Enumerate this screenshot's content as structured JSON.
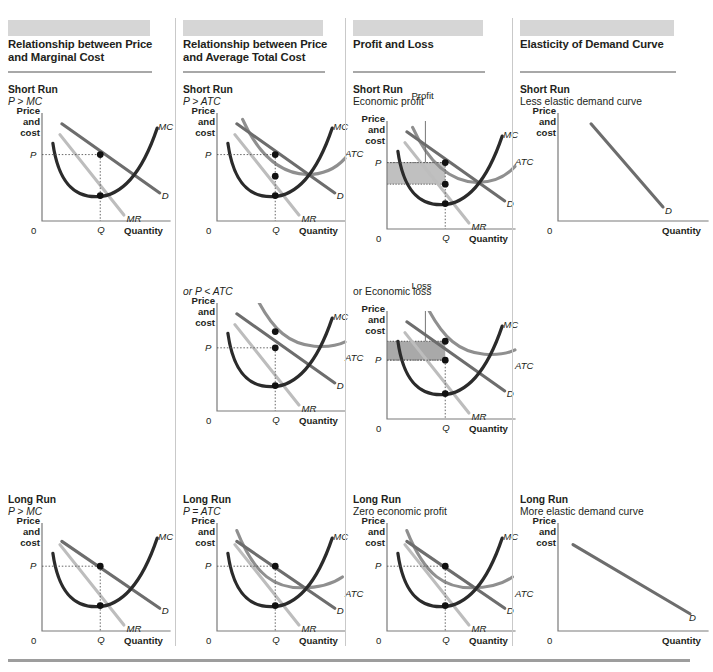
{
  "figure": {
    "title_visible": false,
    "colors": {
      "header_bar": "#d6d6d6",
      "title_rule": "#a8a8a8",
      "divider": "#c9c9c9",
      "mc_curve": "#2b2b2b",
      "d_curve": "#6d6d6d",
      "atc_curve": "#8f8f8f",
      "mr_curve": "#bdbdbd",
      "axis": "#7a7a7a",
      "shade_profit": "#b5b5b5",
      "shade_loss": "#9a9a9a",
      "dot": "#111111",
      "text": "#231f20",
      "bottom_rule": "#9d9d9d"
    },
    "axis": {
      "y_label": "Price\nand\ncost",
      "y_label_lines": [
        "Price",
        "and",
        "cost"
      ],
      "x_label": "Quantity",
      "origin_label": "0",
      "price_tick": "P",
      "quantity_tick": "Q"
    },
    "curve_labels": {
      "mc": "MC",
      "atc": "ATC",
      "d": "D",
      "mr": "MR"
    },
    "bottom_rule": true
  },
  "columns": [
    {
      "id": "price-marginal-cost",
      "title": "Relationship between Price and Marginal Cost",
      "title_lines": [
        "Relationship between Price",
        "and Marginal Cost"
      ],
      "panels": [
        {
          "id": "sr-p-gt-mc",
          "run_label": "Short Run",
          "sub_label": "P > MC",
          "sub_italic": true,
          "curves": [
            "MC",
            "D",
            "MR"
          ],
          "dots": 2,
          "shade": null,
          "annotation": null
        },
        {
          "id": "lr-p-gt-mc",
          "run_label": "Long Run",
          "sub_label": "P > MC",
          "sub_italic": true,
          "curves": [
            "MC",
            "D",
            "MR"
          ],
          "dots": 2,
          "shade": null,
          "annotation": null
        }
      ]
    },
    {
      "id": "price-average-total-cost",
      "title": "Relationship between Price and Average Total Cost",
      "title_lines": [
        "Relationship between Price",
        "and Average Total Cost"
      ],
      "panels": [
        {
          "id": "sr-p-gt-atc",
          "run_label": "Short Run",
          "sub_label": "P > ATC",
          "sub_italic": true,
          "curves": [
            "MC",
            "ATC",
            "D",
            "MR"
          ],
          "dots": 3,
          "shade": null,
          "annotation": null
        },
        {
          "id": "sr-p-lt-atc",
          "run_label": "",
          "sub_label": "or P < ATC",
          "sub_italic": true,
          "curves": [
            "MC",
            "ATC",
            "D",
            "MR"
          ],
          "dots": 3,
          "shade": null,
          "annotation": null
        },
        {
          "id": "lr-p-eq-atc",
          "run_label": "Long Run",
          "sub_label": "P = ATC",
          "sub_italic": true,
          "curves": [
            "MC",
            "ATC",
            "D",
            "MR"
          ],
          "dots": 2,
          "shade": null,
          "annotation": null
        }
      ]
    },
    {
      "id": "profit-and-loss",
      "title": "Profit and Loss",
      "title_lines": [
        "Profit and Loss"
      ],
      "panels": [
        {
          "id": "sr-economic-profit",
          "run_label": "Short Run",
          "sub_label": "Economic profit",
          "sub_italic": false,
          "curves": [
            "MC",
            "ATC",
            "D",
            "MR"
          ],
          "dots": 3,
          "shade": "profit",
          "annotation": "Profit"
        },
        {
          "id": "sr-economic-loss",
          "run_label": "",
          "sub_label": "or Economic loss",
          "sub_italic": false,
          "curves": [
            "MC",
            "ATC",
            "D",
            "MR"
          ],
          "dots": 3,
          "shade": "loss",
          "annotation": "Loss"
        },
        {
          "id": "lr-zero-profit",
          "run_label": "Long Run",
          "sub_label": "Zero economic profit",
          "sub_italic": false,
          "curves": [
            "MC",
            "ATC",
            "D",
            "MR"
          ],
          "dots": 2,
          "shade": null,
          "annotation": null
        }
      ]
    },
    {
      "id": "elasticity-of-demand-curve",
      "title": "Elasticity of Demand Curve",
      "title_lines": [
        "Elasticity of Demand Curve"
      ],
      "panels": [
        {
          "id": "sr-less-elastic",
          "run_label": "Short Run",
          "sub_label": "Less elastic demand curve",
          "sub_italic": false,
          "curves": [
            "D"
          ],
          "dots": 0,
          "shade": null,
          "annotation": null
        },
        {
          "id": "lr-more-elastic",
          "run_label": "Long Run",
          "sub_label": "More elastic demand curve",
          "sub_italic": false,
          "curves": [
            "D"
          ],
          "dots": 0,
          "shade": null,
          "annotation": null
        }
      ]
    }
  ],
  "chart_data": {
    "type": "line",
    "xlabel": "Quantity",
    "ylabel": "Price and cost",
    "grid": false,
    "legend": "inline-curve-labels",
    "axis_ticks": {
      "x": [
        "0",
        "Q"
      ],
      "y": [
        "P"
      ]
    },
    "panels": [
      {
        "name": "Short Run: P > MC",
        "series": [
          {
            "name": "MC",
            "shape": "u-shaped-rising",
            "x": [
              0.08,
              0.14,
              0.22,
              0.32,
              0.45,
              0.58,
              0.72,
              0.88
            ],
            "y": [
              0.62,
              0.38,
              0.26,
              0.22,
              0.26,
              0.38,
              0.55,
              0.8
            ]
          },
          {
            "name": "D",
            "shape": "downward-line",
            "x": [
              0.16,
              0.9
            ],
            "y": [
              0.73,
              0.23
            ]
          },
          {
            "name": "MR",
            "shape": "downward-line-steeper",
            "x": [
              0.14,
              0.62
            ],
            "y": [
              0.7,
              0.1
            ]
          }
        ],
        "equilibrium": {
          "Q": 0.45,
          "P_on_demand": 0.57,
          "MR_eq_MC": 0.26
        },
        "dots": [
          {
            "x": 0.45,
            "y": 0.57
          },
          {
            "x": 0.45,
            "y": 0.26
          }
        ]
      },
      {
        "name": "Short Run: P > ATC",
        "series": [
          {
            "name": "MC",
            "shape": "u-shaped-rising"
          },
          {
            "name": "ATC",
            "shape": "u-shaped-flat"
          },
          {
            "name": "D",
            "shape": "downward-line"
          },
          {
            "name": "MR",
            "shape": "downward-line-steeper"
          }
        ],
        "dots": [
          {
            "label": "P on D"
          },
          {
            "label": "ATC at Q"
          },
          {
            "label": "MR=MC"
          }
        ]
      },
      {
        "name": "Short Run: or P < ATC",
        "series": [
          {
            "name": "MC",
            "shape": "u-shaped-rising"
          },
          {
            "name": "ATC",
            "shape": "u-shaped-flat-high"
          },
          {
            "name": "D",
            "shape": "downward-line"
          },
          {
            "name": "MR",
            "shape": "downward-line-steeper"
          }
        ],
        "dots": [
          {
            "label": "ATC at Q"
          },
          {
            "label": "P on D"
          },
          {
            "label": "MR=MC"
          }
        ]
      },
      {
        "name": "Long Run: P > MC / P = ATC",
        "series": [
          {
            "name": "MC",
            "shape": "u-shaped-rising"
          },
          {
            "name": "ATC",
            "shape": "u-shaped-tangent"
          },
          {
            "name": "D",
            "shape": "downward-line-tangent"
          },
          {
            "name": "MR",
            "shape": "downward-line-steeper"
          }
        ],
        "dots": [
          {
            "label": "P = ATC tangency"
          },
          {
            "label": "MR=MC"
          }
        ]
      },
      {
        "name": "Short Run: Economic profit",
        "shaded_region": {
          "label": "Profit",
          "between": "P and ATC at Q",
          "color": "#b5b5b5"
        }
      },
      {
        "name": "Short Run: Economic loss",
        "shaded_region": {
          "label": "Loss",
          "between": "ATC and P at Q",
          "color": "#9a9a9a"
        }
      },
      {
        "name": "Short Run: Less elastic demand curve",
        "series": [
          {
            "name": "D",
            "shape": "steep-downward-line",
            "x": [
              0.22,
              0.72
            ],
            "y": [
              0.88,
              0.12
            ]
          }
        ]
      },
      {
        "name": "Long Run: More elastic demand curve",
        "series": [
          {
            "name": "D",
            "shape": "shallow-downward-line",
            "x": [
              0.12,
              0.88
            ],
            "y": [
              0.78,
              0.18
            ]
          }
        ]
      }
    ]
  }
}
